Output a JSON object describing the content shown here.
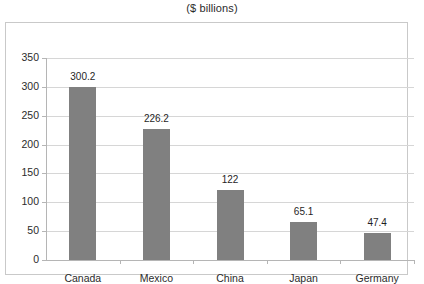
{
  "chart_data": {
    "type": "bar",
    "title": "($ billions)",
    "subtitle": "",
    "xlabel": "",
    "ylabel": "",
    "categories": [
      "Canada",
      "Mexico",
      "China",
      "Japan",
      "Germany"
    ],
    "values": [
      300.2,
      226.2,
      122,
      65.1,
      47.4
    ],
    "value_labels": [
      "300.2",
      "226.2",
      "122",
      "65.1",
      "47.4"
    ],
    "ylim": [
      0,
      350
    ],
    "ytick_values": [
      0,
      50,
      100,
      150,
      200,
      250,
      300,
      350
    ],
    "ytick_labels": [
      "0",
      "50",
      "100",
      "150",
      "200",
      "250",
      "300",
      "350"
    ],
    "grid": true,
    "legend": false,
    "legend_position": "none",
    "bar_color": "#808080",
    "gridline_color": "#d6d6d6",
    "axis_color": "#b5b5b5",
    "frame_border_color": "#c9c9c9",
    "plot_background": "#ffffff",
    "text_color": "#2b2b2b"
  }
}
